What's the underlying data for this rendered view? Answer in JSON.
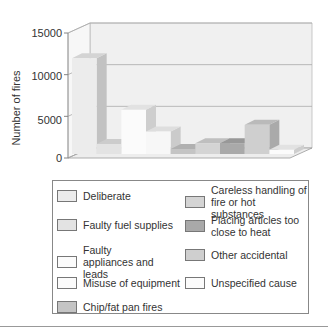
{
  "chart_data": {
    "type": "bar",
    "title": "",
    "xlabel": "",
    "ylabel": "Number of fires",
    "ylim": [
      0,
      15000
    ],
    "yticks": [
      0,
      5000,
      10000,
      15000
    ],
    "grid": true,
    "style": "3d",
    "legend_position": "bottom",
    "categories": [
      "Deliberate",
      "Faulty fuel supplies",
      "Faulty appliances and leads",
      "Misuse of equipment",
      "Chip/fat pan fires",
      "Careless handling of fire or hot substances",
      "Placing articles too close to heat",
      "Other accidental",
      "Unspecified cause"
    ],
    "values": [
      11500,
      1200,
      5300,
      2700,
      600,
      1300,
      1300,
      3500,
      500
    ],
    "colors": [
      "#ececec",
      "#e3e3e3",
      "#fbfbfb",
      "#f7f7f7",
      "#c4c4c4",
      "#d4d4d4",
      "#a9a9a9",
      "#cfcfcf",
      "#fbfbfb"
    ]
  },
  "axis": {
    "ylabel": "Number of fires",
    "ticks": [
      "15000",
      "10000",
      "5000",
      "0"
    ]
  },
  "legend": {
    "left": [
      {
        "label": "Deliberate",
        "color": "#ececec"
      },
      {
        "label": "Faulty fuel supplies",
        "color": "#e3e3e3"
      },
      {
        "label": "Faulty appliances and leads",
        "color": "#fbfbfb"
      },
      {
        "label": "Misuse of equipment",
        "color": "#fbfbfb"
      },
      {
        "label": "Chip/fat pan fires",
        "color": "#c4c4c4"
      }
    ],
    "right": [
      {
        "label": "Careless handling of fire or hot substances",
        "color": "#d4d4d4"
      },
      {
        "label": "Placing articles too close to heat",
        "color": "#a9a9a9"
      },
      {
        "label": "Other accidental",
        "color": "#cfcfcf"
      },
      {
        "label": "Unspecified cause",
        "color": "#fbfbfb"
      }
    ]
  }
}
